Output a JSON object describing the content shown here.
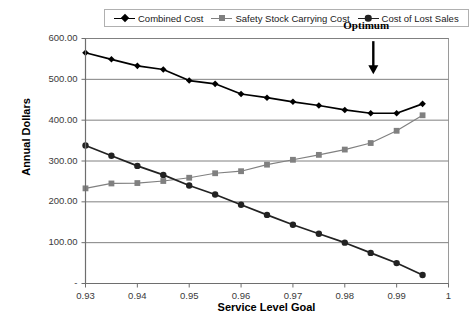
{
  "chart_data": {
    "type": "line",
    "title": "",
    "xlabel": "Service Level Goal",
    "ylabel": "Annual Dollars",
    "xlim": [
      0.93,
      1.0
    ],
    "ylim": [
      0,
      600
    ],
    "grid": true,
    "legend_position": "top",
    "x": [
      0.93,
      0.935,
      0.94,
      0.945,
      0.95,
      0.955,
      0.96,
      0.965,
      0.97,
      0.975,
      0.98,
      0.985,
      0.99,
      0.995
    ],
    "x_tick_labels": [
      "0.93",
      "0.94",
      "0.95",
      "0.96",
      "0.97",
      "0.98",
      "0.99",
      "1"
    ],
    "x_tick_values": [
      0.93,
      0.94,
      0.95,
      0.96,
      0.97,
      0.98,
      0.99,
      1.0
    ],
    "y_tick_labels": [
      "600.00",
      "500.00",
      "400.00",
      "300.00",
      "200.00",
      "100.00",
      "-"
    ],
    "y_tick_values": [
      600,
      500,
      400,
      300,
      200,
      100,
      0
    ],
    "series": [
      {
        "name": "Combined Cost",
        "marker": "diamond",
        "color": "#000000",
        "values": [
          565,
          549,
          533,
          524,
          497,
          489,
          464,
          455,
          445,
          436,
          425,
          417,
          417,
          440
        ]
      },
      {
        "name": "Safety Stock Carrying Cost",
        "marker": "square",
        "color": "#808080",
        "values": [
          233,
          245,
          246,
          251,
          259,
          270,
          275,
          291,
          303,
          315,
          328,
          344,
          374,
          412
        ]
      },
      {
        "name": "Cost of Lost Sales",
        "marker": "circle",
        "color": "#222222",
        "values": [
          338,
          313,
          288,
          266,
          240,
          218,
          193,
          168,
          144,
          122,
          100,
          75,
          50,
          21
        ]
      }
    ],
    "annotations": [
      {
        "text": "Optimum",
        "x": 0.9855,
        "y": 520,
        "arrow": "down"
      }
    ]
  },
  "legend": {
    "entries": [
      {
        "label": "Combined Cost"
      },
      {
        "label": "Safety Stock Carrying Cost"
      },
      {
        "label": "Cost of Lost Sales"
      }
    ]
  },
  "colors": {
    "combined_cost": "#000000",
    "safety_stock": "#808080",
    "lost_sales": "#222222",
    "gridline": "#808080",
    "axis": "#6e6e6e",
    "plot_border": "#9a9a9a"
  }
}
